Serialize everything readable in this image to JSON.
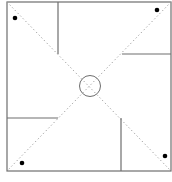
{
  "diagram": {
    "type": "pinwheel-fold-pattern",
    "colors": {
      "background": "#ffffff",
      "border": "#6e6e6e",
      "cut_line": "#6e6e6e",
      "diagonal": "#9a9a9a",
      "center_circle": "#6e6e6e",
      "dot": "#000000"
    },
    "square": {
      "x": 7,
      "y": 2,
      "width": 164,
      "height": 169
    },
    "diagonals": [
      {
        "x1": 7,
        "y1": 2,
        "x2": 171,
        "y2": 171
      },
      {
        "x1": 171,
        "y1": 2,
        "x2": 7,
        "y2": 171
      }
    ],
    "cut_lines": [
      {
        "name": "top-cut",
        "x1": 58,
        "y1": 2,
        "x2": 58,
        "y2": 54
      },
      {
        "name": "right-cut",
        "x1": 122,
        "y1": 54,
        "x2": 171,
        "y2": 54
      },
      {
        "name": "bottom-cut",
        "x1": 121,
        "y1": 118,
        "x2": 121,
        "y2": 171
      },
      {
        "name": "left-cut",
        "x1": 7,
        "y1": 118,
        "x2": 58,
        "y2": 118
      }
    ],
    "center_circle": {
      "cx": 90,
      "cy": 86,
      "r": 10.5
    },
    "dots": [
      {
        "name": "dot-top-left",
        "cx": 15,
        "cy": 18,
        "r": 2.3
      },
      {
        "name": "dot-top-right",
        "cx": 157,
        "cy": 10,
        "r": 2.3
      },
      {
        "name": "dot-bottom-left",
        "cx": 22,
        "cy": 163,
        "r": 2.3
      },
      {
        "name": "dot-bottom-right",
        "cx": 165,
        "cy": 156,
        "r": 2.3
      }
    ]
  }
}
